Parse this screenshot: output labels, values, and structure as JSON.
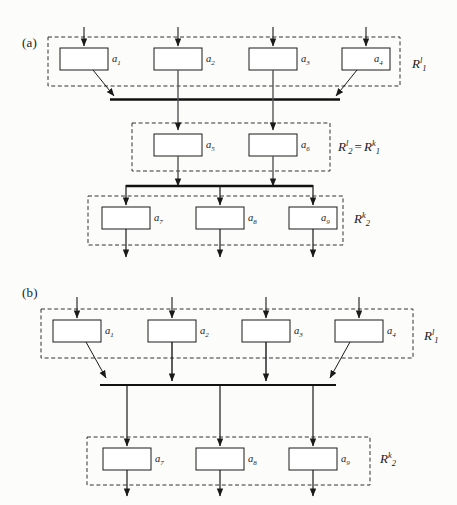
{
  "figure": {
    "background_color": "#fcfcfb",
    "stroke_color": "#1a1a1a",
    "box_fill": "#ffffff",
    "dashed_color": "#333333",
    "bus_color": "#000000"
  },
  "panels": [
    {
      "id": "panel-a",
      "tag": "(a)",
      "regions": [
        {
          "id": "region-a-r1l",
          "label_base": "R",
          "label_sub": "1",
          "label_sup": "l",
          "label_text": "R1l",
          "units": [
            {
              "id": "a1",
              "label_base": "a",
              "label_sub": "1"
            },
            {
              "id": "a2",
              "label_base": "a",
              "label_sub": "2"
            },
            {
              "id": "a3",
              "label_base": "a",
              "label_sub": "3"
            },
            {
              "id": "a4",
              "label_base": "a",
              "label_sub": "4"
            }
          ]
        },
        {
          "id": "region-a-r2l-r1k",
          "label_base": "R",
          "label_sub": "2",
          "label_sup": "l",
          "equals": "=",
          "label2_base": "R",
          "label2_sub": "1",
          "label2_sup": "k",
          "label_text": "R2l = R1k",
          "units": [
            {
              "id": "a5",
              "label_base": "a",
              "label_sub": "5"
            },
            {
              "id": "a6",
              "label_base": "a",
              "label_sub": "6"
            }
          ]
        },
        {
          "id": "region-a-r2k",
          "label_base": "R",
          "label_sub": "2",
          "label_sup": "k",
          "label_text": "R2k",
          "units": [
            {
              "id": "a7",
              "label_base": "a",
              "label_sub": "7"
            },
            {
              "id": "a8",
              "label_base": "a",
              "label_sub": "8"
            },
            {
              "id": "a9",
              "label_base": "a",
              "label_sub": "9"
            }
          ]
        }
      ]
    },
    {
      "id": "panel-b",
      "tag": "(b)",
      "regions": [
        {
          "id": "region-b-r1l",
          "label_base": "R",
          "label_sub": "1",
          "label_sup": "l",
          "label_text": "R1l",
          "units": [
            {
              "id": "b1",
              "label_base": "a",
              "label_sub": "1"
            },
            {
              "id": "b2",
              "label_base": "a",
              "label_sub": "2"
            },
            {
              "id": "b3",
              "label_base": "a",
              "label_sub": "3"
            },
            {
              "id": "b4",
              "label_base": "a",
              "label_sub": "4"
            }
          ]
        },
        {
          "id": "region-b-r2k",
          "label_base": "R",
          "label_sub": "2",
          "label_sup": "k",
          "label_text": "R2k",
          "units": [
            {
              "id": "b7",
              "label_base": "a",
              "label_sub": "7"
            },
            {
              "id": "b8",
              "label_base": "a",
              "label_sub": "8"
            },
            {
              "id": "b9",
              "label_base": "a",
              "label_sub": "9"
            }
          ]
        }
      ]
    }
  ]
}
